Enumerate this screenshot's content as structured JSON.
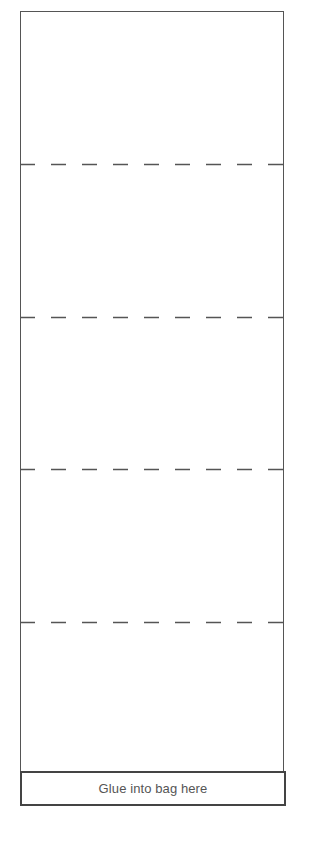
{
  "template": {
    "type": "fold-and-glue strip",
    "panel_count": 5,
    "fold_lines": [
      {
        "y": 163
      },
      {
        "y": 316
      },
      {
        "y": 468
      },
      {
        "y": 621
      }
    ],
    "colors": {
      "line": "#555555",
      "glue_border": "#444444",
      "text": "#555555",
      "background": "#ffffff"
    }
  },
  "glue_area": {
    "label": "Glue into bag here"
  }
}
